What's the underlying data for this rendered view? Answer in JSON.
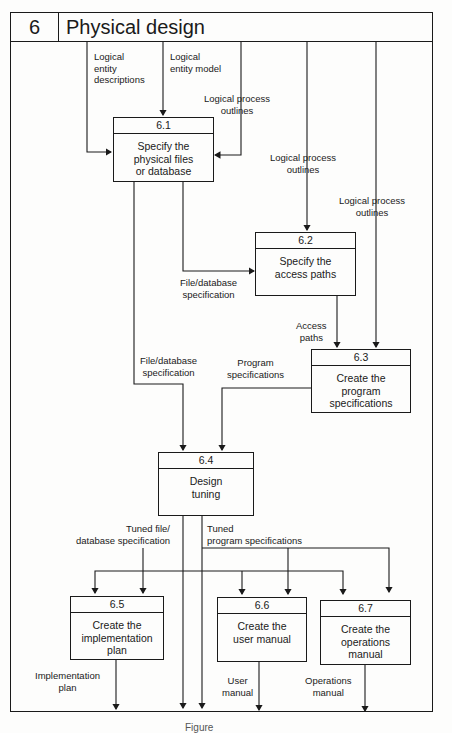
{
  "header": {
    "number": "6",
    "title": "Physical design"
  },
  "processes": [
    {
      "id": "6.1",
      "label": "Specify the\nphysical files\nor database"
    },
    {
      "id": "6.2",
      "label": "Specify the\naccess paths"
    },
    {
      "id": "6.3",
      "label": "Create the\nprogram\nspecifications"
    },
    {
      "id": "6.4",
      "label": "Design\ntuning"
    },
    {
      "id": "6.5",
      "label": "Create the\nimplementation\nplan"
    },
    {
      "id": "6.6",
      "label": "Create the\nuser manual"
    },
    {
      "id": "6.7",
      "label": "Create the\noperations\nmanual"
    }
  ],
  "flows": {
    "logical_entity_descriptions": "Logical\nentity\ndescriptions",
    "logical_entity_model": "Logical\nentity model",
    "logical_process_outlines_1": "Logical process\noutlines",
    "logical_process_outlines_2": "Logical process\noutlines",
    "logical_process_outlines_3": "Logical process\noutlines",
    "file_database_spec_1": "File/database\nspecification",
    "file_database_spec_2": "File/database\nspecification",
    "access_paths": "Access\npaths",
    "program_specifications": "Program\nspecifications",
    "tuned_file_db_spec": "Tuned file/\ndatabase specification",
    "tuned_program_specs": "Tuned\nprogram specifications",
    "implementation_plan": "Implementation\nplan",
    "user_manual": "User\nmanual",
    "operations_manual": "Operations\nmanual"
  },
  "caption": "Figure"
}
